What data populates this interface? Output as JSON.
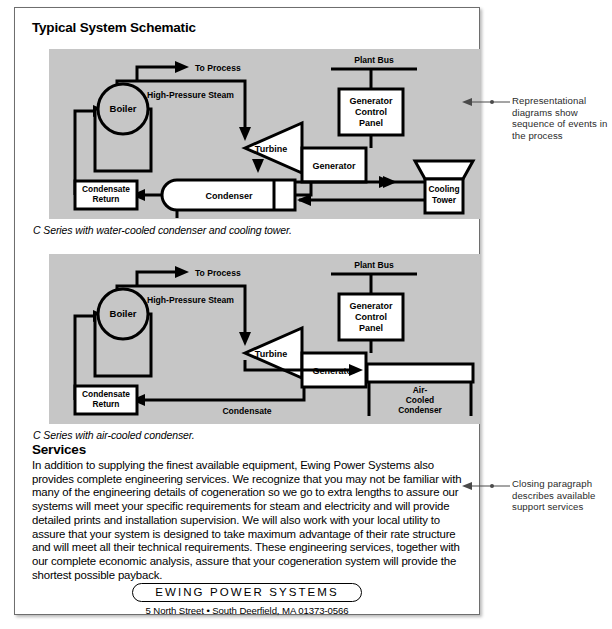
{
  "page": {
    "title": "Typical System Schematic",
    "services_heading": "Services",
    "services_paragraph": "In addition to supplying the finest available equipment, Ewing Power Systems also provides complete engineering services. We recognize that you may not be familiar with many of the engineering details of cogeneration so we go to extra lengths to assure our systems will meet your specific requirements for steam and electricity and will provide detailed prints and installation supervision. We will also work with your local utility to assure that your system is designed to take maximum advantage of their rate structure and will meet all their technical requirements. These engineering services, together with our complete economic analysis, assure that your cogeneration system will provide the shortest possible payback."
  },
  "captions": {
    "diagram_1": "C Series with water-cooled condenser and cooling tower.",
    "diagram_2": "C Series with air-cooled condenser."
  },
  "diagram_1": {
    "name": "water-cooled-condenser-schematic",
    "labels": {
      "to_process": "To Process",
      "high_pressure_steam": "High-Pressure Steam",
      "boiler": "Boiler",
      "condensate_return_line1": "Condensate",
      "condensate_return_line2": "Return",
      "plant_bus": "Plant Bus",
      "generator_control_panel_line1": "Generator",
      "generator_control_panel_line2": "Control",
      "generator_control_panel_line3": "Panel",
      "turbine": "Turbine",
      "generator": "Generator",
      "condenser": "Condenser",
      "cooling_tower_line1": "Cooling",
      "cooling_tower_line2": "Tower"
    }
  },
  "diagram_2": {
    "name": "air-cooled-condenser-schematic",
    "labels": {
      "to_process": "To Process",
      "high_pressure_steam": "High-Pressure Steam",
      "boiler": "Boiler",
      "condensate_return_line1": "Condensate",
      "condensate_return_line2": "Return",
      "condensate": "Condensate",
      "plant_bus": "Plant Bus",
      "generator_control_panel_line1": "Generator",
      "generator_control_panel_line2": "Control",
      "generator_control_panel_line3": "Panel",
      "turbine": "Turbine",
      "generator": "Generator",
      "air_cooled_condenser_line1": "Air-",
      "air_cooled_condenser_line2": "Cooled",
      "air_cooled_condenser_line3": "Condenser"
    }
  },
  "footer": {
    "logo": "EWING POWER SYSTEMS",
    "address": "5 North Street • South Deerfield, MA 01373-0566"
  },
  "annotations": {
    "top": "Representational diagrams show sequence of events in the process",
    "bottom": "Closing paragraph describes available support services"
  },
  "colors": {
    "diagram_background": "#c6c6c6",
    "shape_fill": "#ffffff",
    "stroke": "#000000",
    "page_border": "#6e6e6e",
    "annotation_text": "#2b2b2b"
  }
}
